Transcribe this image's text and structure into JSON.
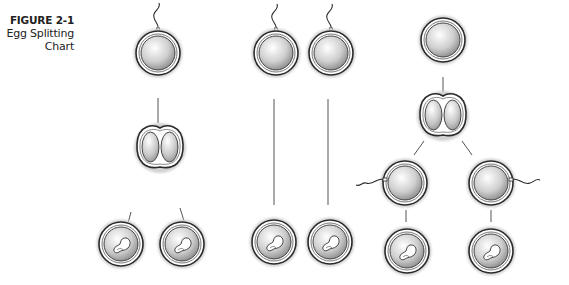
{
  "caption": {
    "figure_label": "FIGURE 2-1",
    "title_line1": "Egg Splitting",
    "title_line2": "Chart"
  },
  "colors": {
    "outline": "#2a2a2a",
    "halo": "#c8c8c8",
    "fill_light": "#ffffff",
    "fill_dark": "#8a8a8a",
    "connector": "#555555"
  },
  "diagram": {
    "columns": [
      {
        "name": "identical-twins",
        "stages": [
          "fertilized-egg",
          "split-egg",
          "two-embryos"
        ]
      },
      {
        "name": "fraternal-twins",
        "stages": [
          "two-fertilized-eggs",
          "two-embryos"
        ]
      },
      {
        "name": "split-then-fertilized",
        "stages": [
          "egg",
          "split-egg",
          "two-fertilized-halves",
          "two-embryos"
        ]
      }
    ]
  }
}
